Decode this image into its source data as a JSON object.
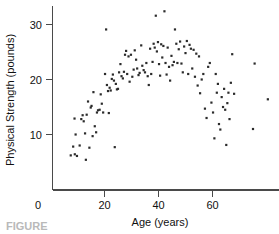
{
  "figure": {
    "caption_partial": "FIGURE"
  },
  "chart_data": {
    "type": "scatter",
    "title": "",
    "xlabel": "Age (years)",
    "ylabel": "Physical Strength (pounds)",
    "xlim": [
      3.5,
      84
    ],
    "ylim": [
      0,
      34
    ],
    "xticks": [
      0,
      20,
      40,
      60
    ],
    "yticks": [
      0,
      10,
      20,
      30
    ],
    "xtick_labels": [
      "0",
      "20",
      "40",
      "60"
    ],
    "ytick_labels": [
      "0",
      "10",
      "20",
      "30"
    ],
    "grid": false,
    "legend": null,
    "marker": "square-dot",
    "marker_color": "#2b2b2b",
    "marker_size_px": 2.2,
    "n_points": 133,
    "points": [
      [
        7.5,
        6.2
      ],
      [
        9.0,
        6.4
      ],
      [
        9.8,
        6.1
      ],
      [
        8.4,
        7.8
      ],
      [
        8.9,
        12.9
      ],
      [
        9.3,
        10.0
      ],
      [
        10.8,
        8.0
      ],
      [
        11.4,
        12.8
      ],
      [
        11.9,
        13.5
      ],
      [
        12.3,
        12.4
      ],
      [
        12.8,
        10.2
      ],
      [
        13.1,
        5.4
      ],
      [
        13.4,
        13.6
      ],
      [
        13.9,
        16.0
      ],
      [
        14.4,
        7.6
      ],
      [
        14.9,
        14.9
      ],
      [
        15.2,
        15.2
      ],
      [
        15.6,
        9.7
      ],
      [
        15.9,
        17.7
      ],
      [
        16.4,
        11.5
      ],
      [
        16.9,
        10.4
      ],
      [
        17.2,
        14.0
      ],
      [
        17.6,
        14.4
      ],
      [
        18.2,
        14.5
      ],
      [
        18.6,
        17.3
      ],
      [
        19.0,
        15.6
      ],
      [
        19.5,
        14.0
      ],
      [
        20.2,
        21.0
      ],
      [
        20.6,
        29.1
      ],
      [
        20.9,
        19.0
      ],
      [
        21.3,
        17.9
      ],
      [
        21.6,
        13.9
      ],
      [
        21.9,
        18.5
      ],
      [
        22.3,
        18.0
      ],
      [
        22.7,
        20.1
      ],
      [
        23.1,
        20.9
      ],
      [
        23.5,
        19.8
      ],
      [
        23.8,
        7.7
      ],
      [
        24.2,
        19.2
      ],
      [
        24.6,
        18.2
      ],
      [
        25.0,
        18.3
      ],
      [
        25.4,
        21.3
      ],
      [
        25.9,
        22.8
      ],
      [
        26.3,
        20.6
      ],
      [
        26.8,
        20.2
      ],
      [
        27.2,
        21.4
      ],
      [
        27.6,
        24.5
      ],
      [
        28.0,
        25.2
      ],
      [
        28.4,
        21.0
      ],
      [
        28.9,
        24.2
      ],
      [
        29.3,
        19.6
      ],
      [
        29.8,
        24.5
      ],
      [
        30.3,
        20.5
      ],
      [
        30.8,
        21.8
      ],
      [
        31.2,
        25.3
      ],
      [
        31.7,
        23.6
      ],
      [
        32.1,
        22.0
      ],
      [
        32.6,
        20.8
      ],
      [
        33.0,
        21.2
      ],
      [
        33.6,
        26.2
      ],
      [
        34.0,
        22.5
      ],
      [
        34.5,
        21.7
      ],
      [
        35.0,
        21.3
      ],
      [
        35.5,
        23.0
      ],
      [
        36.0,
        20.6
      ],
      [
        36.4,
        19.0
      ],
      [
        36.9,
        25.6
      ],
      [
        37.3,
        21.0
      ],
      [
        37.8,
        23.2
      ],
      [
        38.2,
        26.5
      ],
      [
        38.6,
        25.8
      ],
      [
        39.0,
        31.6
      ],
      [
        39.4,
        25.1
      ],
      [
        39.8,
        26.8
      ],
      [
        40.2,
        22.8
      ],
      [
        40.6,
        20.7
      ],
      [
        41.0,
        26.4
      ],
      [
        41.4,
        24.0
      ],
      [
        41.8,
        26.1
      ],
      [
        42.2,
        32.4
      ],
      [
        42.6,
        23.0
      ],
      [
        43.0,
        20.9
      ],
      [
        43.4,
        25.8
      ],
      [
        43.9,
        22.3
      ],
      [
        44.3,
        19.8
      ],
      [
        44.8,
        24.3
      ],
      [
        45.2,
        22.6
      ],
      [
        45.7,
        23.2
      ],
      [
        46.1,
        29.1
      ],
      [
        46.6,
        26.5
      ],
      [
        47.0,
        23.0
      ],
      [
        47.5,
        25.5
      ],
      [
        48.0,
        26.9
      ],
      [
        48.5,
        22.9
      ],
      [
        49.0,
        21.3
      ],
      [
        49.5,
        26.0
      ],
      [
        50.0,
        24.8
      ],
      [
        50.5,
        27.0
      ],
      [
        51.0,
        21.0
      ],
      [
        51.5,
        26.3
      ],
      [
        52.0,
        25.6
      ],
      [
        52.5,
        22.0
      ],
      [
        53.0,
        25.4
      ],
      [
        53.5,
        20.5
      ],
      [
        54.0,
        24.7
      ],
      [
        54.5,
        18.9
      ],
      [
        55.0,
        24.2
      ],
      [
        55.4,
        17.5
      ],
      [
        56.0,
        20.0
      ],
      [
        56.6,
        21.0
      ],
      [
        57.2,
        14.7
      ],
      [
        57.8,
        13.0
      ],
      [
        58.4,
        22.3
      ],
      [
        59.0,
        23.0
      ],
      [
        59.6,
        15.8
      ],
      [
        60.2,
        14.0
      ],
      [
        60.7,
        9.3
      ],
      [
        61.2,
        21.0
      ],
      [
        61.6,
        17.6
      ],
      [
        62.0,
        19.2
      ],
      [
        62.4,
        11.9
      ],
      [
        62.9,
        10.9
      ],
      [
        63.4,
        16.8
      ],
      [
        63.9,
        15.0
      ],
      [
        64.3,
        18.3
      ],
      [
        64.7,
        14.5
      ],
      [
        65.1,
        8.1
      ],
      [
        65.5,
        15.7
      ],
      [
        65.9,
        17.6
      ],
      [
        66.3,
        12.8
      ],
      [
        66.8,
        19.4
      ],
      [
        67.3,
        24.6
      ],
      [
        68.0,
        17.4
      ],
      [
        75.0,
        11.0
      ],
      [
        75.6,
        22.9
      ],
      [
        80.5,
        16.4
      ]
    ]
  }
}
